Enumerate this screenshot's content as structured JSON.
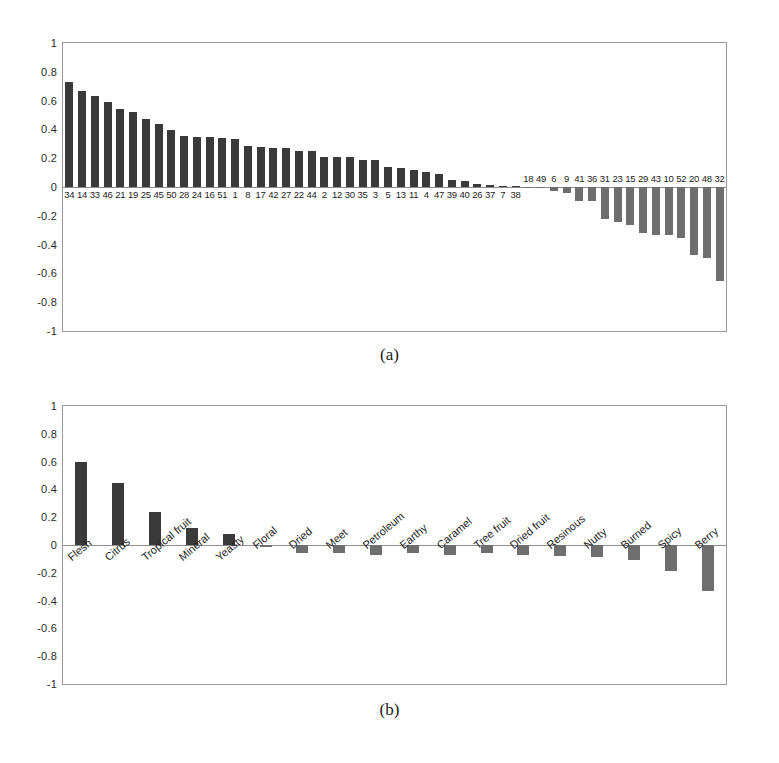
{
  "figure": {
    "caption_a": "(a)",
    "caption_b": "(b)"
  },
  "chart_data": [
    {
      "id": "panel-a",
      "type": "bar",
      "title": "",
      "xlabel": "",
      "ylabel": "",
      "ylim": [
        -1,
        1
      ],
      "grid": false,
      "legend": "none",
      "yticks": [
        "1",
        "0.8",
        "0.6",
        "0.4",
        "0.2",
        "0",
        "-0.2",
        "-0.4",
        "-0.6",
        "-0.8",
        "-1"
      ],
      "ytick_values": [
        1,
        0.8,
        0.6,
        0.4,
        0.2,
        0,
        -0.2,
        -0.4,
        -0.6,
        -0.8,
        -1
      ],
      "categories": [
        "34",
        "14",
        "33",
        "46",
        "21",
        "19",
        "25",
        "45",
        "50",
        "28",
        "24",
        "16",
        "51",
        "1",
        "8",
        "17",
        "42",
        "27",
        "22",
        "44",
        "2",
        "12",
        "30",
        "35",
        "3",
        "5",
        "13",
        "11",
        "4",
        "47",
        "39",
        "40",
        "26",
        "37",
        "7",
        "38",
        "18",
        "49",
        "6",
        "9",
        "41",
        "36",
        "31",
        "23",
        "15",
        "29",
        "43",
        "10",
        "52",
        "20",
        "48",
        "32"
      ],
      "values": [
        0.73,
        0.67,
        0.63,
        0.59,
        0.54,
        0.52,
        0.47,
        0.435,
        0.395,
        0.355,
        0.35,
        0.345,
        0.34,
        0.33,
        0.285,
        0.28,
        0.27,
        0.27,
        0.25,
        0.25,
        0.21,
        0.21,
        0.21,
        0.19,
        0.185,
        0.14,
        0.135,
        0.115,
        0.105,
        0.09,
        0.05,
        0.04,
        0.02,
        0.015,
        0.01,
        0.005,
        -0.005,
        -0.01,
        -0.03,
        -0.04,
        -0.095,
        -0.095,
        -0.22,
        -0.245,
        -0.265,
        -0.32,
        -0.33,
        -0.33,
        -0.355,
        -0.475,
        -0.49,
        -0.65
      ]
    },
    {
      "id": "panel-b",
      "type": "bar",
      "title": "",
      "xlabel": "",
      "ylabel": "",
      "ylim": [
        -1,
        1
      ],
      "grid": false,
      "legend": "none",
      "yticks": [
        "1",
        "0.8",
        "0.6",
        "0.4",
        "0.2",
        "0",
        "-0.2",
        "-0.4",
        "-0.6",
        "-0.8",
        "-1"
      ],
      "ytick_values": [
        1,
        0.8,
        0.6,
        0.4,
        0.2,
        0,
        -0.2,
        -0.4,
        -0.6,
        -0.8,
        -1
      ],
      "categories": [
        "Flesh",
        "Citrus",
        "Tropical fruit",
        "Mineral",
        "Yeasty",
        "Floral",
        "Dried",
        "Meet",
        "Petroleum",
        "Earthy",
        "Caramel",
        "Tree fruit",
        "Dried fruit",
        "Resinous",
        "Nutty",
        "Burned",
        "Spicy",
        "Berry"
      ],
      "values": [
        0.6,
        0.445,
        0.235,
        0.125,
        0.08,
        -0.015,
        -0.055,
        -0.055,
        -0.075,
        -0.06,
        -0.07,
        -0.055,
        -0.07,
        -0.08,
        -0.085,
        -0.11,
        -0.185,
        -0.33
      ]
    }
  ]
}
